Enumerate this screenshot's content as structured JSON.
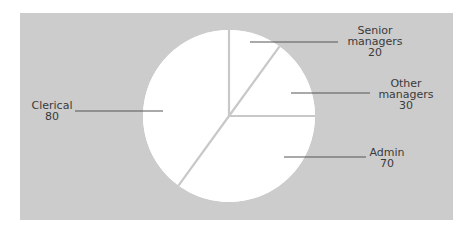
{
  "chart_data": {
    "type": "pie",
    "title": "",
    "categories": [
      "Senior managers",
      "Other managers",
      "Admin",
      "Clerical"
    ],
    "values": [
      20,
      30,
      70,
      80
    ],
    "start_angle": "12 o'clock",
    "direction": "clockwise",
    "legend": "none (direct labels with leader lines)",
    "colors": {
      "background_panel": "#cccccc",
      "slice_fill": "#ffffff",
      "slice_separator": "#c8c8c8",
      "leader_line": "#555555",
      "text": "#3a3a3a"
    }
  },
  "labels": [
    {
      "name": "Senior",
      "name2": "managers",
      "value": "20"
    },
    {
      "name": "Other",
      "name2": "managers",
      "value": "30"
    },
    {
      "name": "Admin",
      "value": "70"
    },
    {
      "name": "Clerical",
      "value": "80"
    }
  ]
}
